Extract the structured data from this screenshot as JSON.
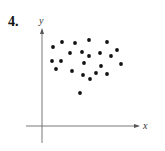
{
  "problem_number": "4.",
  "chart_data": {
    "type": "scatter",
    "title": "",
    "xlabel": "x",
    "ylabel": "y",
    "grid": false,
    "legend": null,
    "ticks": "none",
    "points_pixel": [
      [
        53,
        47
      ],
      [
        62,
        42
      ],
      [
        75,
        43
      ],
      [
        89,
        40
      ],
      [
        107,
        42
      ],
      [
        70,
        53
      ],
      [
        82,
        52
      ],
      [
        89,
        56
      ],
      [
        100,
        53
      ],
      [
        111,
        56
      ],
      [
        117,
        50
      ],
      [
        52,
        61
      ],
      [
        61,
        61
      ],
      [
        84,
        63
      ],
      [
        101,
        66
      ],
      [
        121,
        64
      ],
      [
        56,
        69
      ],
      [
        72,
        71
      ],
      [
        83,
        75
      ],
      [
        96,
        73
      ],
      [
        107,
        74
      ],
      [
        90,
        79
      ],
      [
        80,
        93
      ]
    ],
    "axes_pixel": {
      "origin": [
        42,
        126
      ],
      "x_end": 140,
      "y_end": 28
    },
    "colors": {
      "points": "#111111",
      "axes": "#555555"
    }
  }
}
